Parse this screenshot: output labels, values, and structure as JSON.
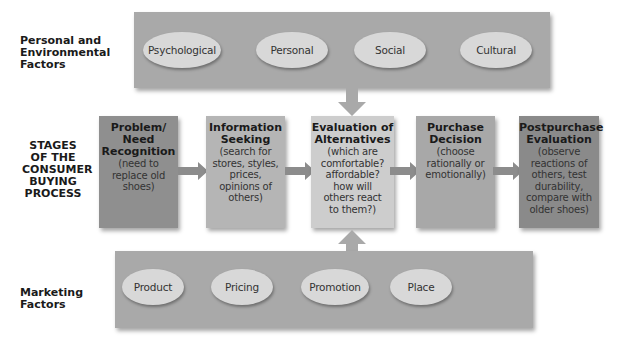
{
  "rows": {
    "personal_env": {
      "label": "Personal and Environmental Factors",
      "label_lines": [
        "Personal and",
        "Environmental",
        "Factors"
      ],
      "factors": [
        "Psychological",
        "Personal",
        "Social",
        "Cultural"
      ]
    },
    "stages": {
      "label": "STAGES OF THE CONSUMER BUYING PROCESS",
      "label_lines": [
        "STAGES",
        "OF THE",
        "CONSUMER",
        "BUYING",
        "PROCESS"
      ],
      "items": [
        {
          "title_lines": [
            "Problem/",
            "Need",
            "Recognition"
          ],
          "desc_lines": [
            "(need to",
            "replace old",
            "shoes)"
          ],
          "color": "#8f8f8f"
        },
        {
          "title_lines": [
            "Information",
            "Seeking"
          ],
          "desc_lines": [
            "(search for",
            "stores, styles,",
            "prices,",
            "opinions of",
            "others)"
          ],
          "color": "#b5b5b5"
        },
        {
          "title_lines": [
            "Evaluation of",
            "Alternatives"
          ],
          "desc_lines": [
            "(which are",
            "comfortable?",
            "affordable?",
            "how will",
            "others react",
            "to them?)"
          ],
          "color": "#cdcdcd"
        },
        {
          "title_lines": [
            "Purchase",
            "Decision"
          ],
          "desc_lines": [
            "(choose",
            "rationally or",
            "emotionally)"
          ],
          "color": "#a8a8a8"
        },
        {
          "title_lines": [
            "Postpurchase",
            "Evaluation"
          ],
          "desc_lines": [
            "(observe",
            "reactions of",
            "others, test",
            "durability,",
            "compare with",
            "older shoes)"
          ],
          "color": "#8a8a8a"
        }
      ]
    },
    "marketing": {
      "label": "Marketing Factors",
      "label_lines": [
        "Marketing",
        "Factors"
      ],
      "factors": [
        "Product",
        "Pricing",
        "Promotion",
        "Place"
      ]
    }
  },
  "colors": {
    "panel": "#a9a9a9",
    "ellipse": "#d8d8d8",
    "arrow": "#8c8c8c",
    "v_arrow": "#a9a9a9"
  }
}
